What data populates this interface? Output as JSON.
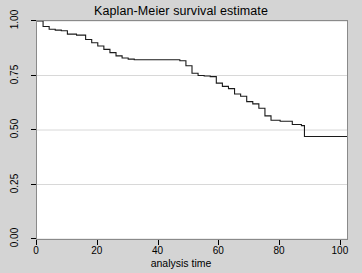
{
  "chart_data": {
    "type": "line",
    "subtype": "step",
    "title": "Kaplan-Meier survival estimate",
    "xlabel": "analysis time",
    "ylabel": "",
    "xlim": [
      0,
      102
    ],
    "ylim": [
      0,
      1.0
    ],
    "xticks": [
      0,
      20,
      40,
      60,
      80,
      100
    ],
    "xtick_labels": [
      "0",
      "20",
      "40",
      "60",
      "80",
      "100"
    ],
    "yticks": [
      0.0,
      0.25,
      0.5,
      0.75,
      1.0
    ],
    "ytick_labels": [
      "0.00",
      "0.25",
      "0.50",
      "0.75",
      "1.00"
    ],
    "grid": "horizontal",
    "legend": "none",
    "series": [
      {
        "name": "survival",
        "color": "#1a1a1a",
        "x": [
          0,
          1,
          2,
          4,
          6,
          8,
          10,
          13,
          16,
          18,
          20,
          22,
          24,
          26,
          28,
          30,
          32,
          34,
          35,
          47,
          49,
          51,
          53,
          55,
          57,
          59,
          61,
          63,
          65,
          67,
          69,
          71,
          73,
          75,
          77,
          80,
          84,
          87,
          88,
          96
        ],
        "y": [
          1.0,
          1.0,
          0.975,
          0.962,
          0.958,
          0.955,
          0.94,
          0.935,
          0.915,
          0.9,
          0.885,
          0.87,
          0.855,
          0.84,
          0.83,
          0.825,
          0.822,
          0.822,
          0.822,
          0.818,
          0.795,
          0.76,
          0.75,
          0.748,
          0.745,
          0.715,
          0.7,
          0.69,
          0.665,
          0.655,
          0.63,
          0.62,
          0.6,
          0.565,
          0.545,
          0.54,
          0.525,
          0.52,
          0.47,
          0.47
        ]
      }
    ]
  },
  "axes": {
    "x_tick_positions_px": [
      36,
      98,
      161,
      223,
      286,
      348
    ],
    "y_tick_positions_px": [
      240,
      187,
      134,
      82,
      29
    ]
  }
}
